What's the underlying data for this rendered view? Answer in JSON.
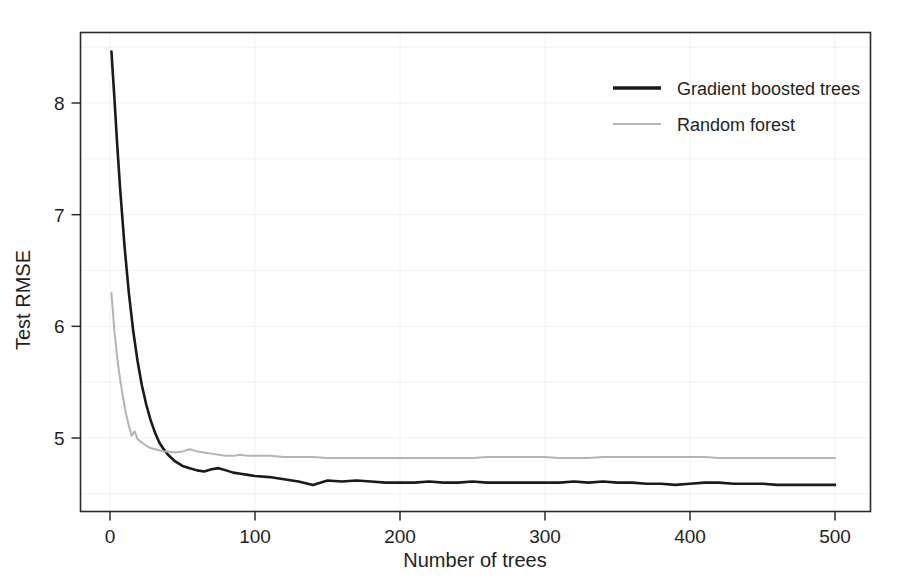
{
  "chart_data": {
    "type": "line",
    "title": "",
    "xlabel": "Number of trees",
    "ylabel": "Test RMSE",
    "xlim": [
      0,
      500
    ],
    "ylim": [
      4.35,
      8.65
    ],
    "xticks": [
      0,
      100,
      200,
      300,
      400,
      500
    ],
    "yticks": [
      5,
      6,
      7,
      8
    ],
    "xtick_labels": [
      "0",
      "100",
      "200",
      "300",
      "400",
      "500"
    ],
    "ytick_labels": [
      "5",
      "6",
      "7",
      "8"
    ],
    "grid": true,
    "legend_position": "top-right",
    "series": [
      {
        "name": "Gradient boosted trees",
        "color": "#1a1a1a",
        "x": [
          1,
          3,
          5,
          7,
          10,
          13,
          16,
          19,
          22,
          25,
          28,
          31,
          34,
          37,
          40,
          45,
          50,
          55,
          60,
          65,
          70,
          75,
          80,
          85,
          90,
          95,
          100,
          110,
          120,
          130,
          140,
          145,
          150,
          160,
          170,
          180,
          190,
          200,
          210,
          220,
          230,
          240,
          250,
          260,
          270,
          280,
          290,
          300,
          310,
          320,
          330,
          340,
          350,
          360,
          370,
          380,
          390,
          400,
          410,
          420,
          430,
          440,
          450,
          460,
          470,
          480,
          490,
          500
        ],
        "values": [
          8.46,
          8.05,
          7.62,
          7.23,
          6.72,
          6.3,
          5.96,
          5.69,
          5.47,
          5.3,
          5.16,
          5.05,
          4.96,
          4.9,
          4.85,
          4.79,
          4.75,
          4.73,
          4.71,
          4.7,
          4.72,
          4.73,
          4.71,
          4.69,
          4.68,
          4.67,
          4.66,
          4.65,
          4.63,
          4.61,
          4.58,
          4.6,
          4.62,
          4.61,
          4.62,
          4.61,
          4.6,
          4.6,
          4.6,
          4.61,
          4.6,
          4.6,
          4.61,
          4.6,
          4.6,
          4.6,
          4.6,
          4.6,
          4.6,
          4.61,
          4.6,
          4.61,
          4.6,
          4.6,
          4.59,
          4.59,
          4.58,
          4.59,
          4.6,
          4.6,
          4.59,
          4.59,
          4.59,
          4.58,
          4.58,
          4.58,
          4.58,
          4.58
        ]
      },
      {
        "name": "Random forest",
        "color": "#b4b4b4",
        "x": [
          1,
          3,
          5,
          7,
          9,
          11,
          13,
          15,
          17,
          19,
          21,
          23,
          25,
          28,
          31,
          34,
          37,
          40,
          45,
          50,
          55,
          60,
          65,
          70,
          75,
          80,
          85,
          90,
          95,
          100,
          110,
          120,
          130,
          140,
          150,
          160,
          170,
          180,
          190,
          200,
          210,
          220,
          230,
          240,
          250,
          260,
          270,
          280,
          290,
          300,
          310,
          320,
          330,
          340,
          350,
          360,
          370,
          380,
          390,
          400,
          410,
          420,
          430,
          440,
          450,
          460,
          470,
          480,
          490,
          500
        ],
        "values": [
          6.3,
          5.96,
          5.72,
          5.52,
          5.36,
          5.22,
          5.11,
          5.02,
          5.06,
          4.99,
          4.97,
          4.95,
          4.93,
          4.91,
          4.9,
          4.89,
          4.88,
          4.88,
          4.87,
          4.88,
          4.9,
          4.88,
          4.87,
          4.86,
          4.85,
          4.84,
          4.84,
          4.85,
          4.84,
          4.84,
          4.84,
          4.83,
          4.83,
          4.83,
          4.82,
          4.82,
          4.82,
          4.82,
          4.82,
          4.82,
          4.82,
          4.82,
          4.82,
          4.82,
          4.82,
          4.83,
          4.83,
          4.83,
          4.83,
          4.83,
          4.82,
          4.82,
          4.82,
          4.83,
          4.83,
          4.83,
          4.83,
          4.83,
          4.83,
          4.83,
          4.83,
          4.82,
          4.82,
          4.82,
          4.82,
          4.82,
          4.82,
          4.82,
          4.82,
          4.82
        ]
      }
    ]
  },
  "legend": {
    "entries": [
      {
        "label": "Gradient boosted trees",
        "color": "#1a1a1a"
      },
      {
        "label": "Random forest",
        "color": "#b4b4b4"
      }
    ]
  },
  "axes": {
    "x_title": "Number of trees",
    "y_title": "Test RMSE"
  }
}
